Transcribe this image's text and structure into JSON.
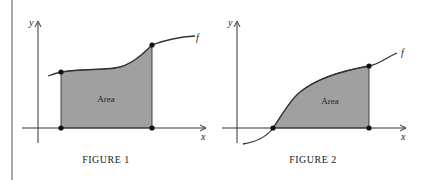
{
  "figures": [
    {
      "id": "figure-1",
      "caption": "FIGURE 1",
      "x_label": "x",
      "y_label": "y",
      "function_label": "f",
      "area_label": "Area"
    },
    {
      "id": "figure-2",
      "caption": "FIGURE 2",
      "x_label": "x",
      "y_label": "y",
      "function_label": "f",
      "area_label": "Area"
    }
  ],
  "colors": {
    "area_fill": "#a0a0a0",
    "stroke": "#333333",
    "background": "#ffffff"
  }
}
